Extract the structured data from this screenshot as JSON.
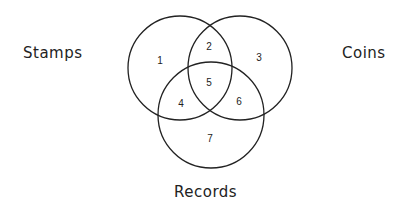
{
  "diagram": {
    "type": "venn",
    "sets": [
      {
        "label": "Stamps",
        "region_only": "1"
      },
      {
        "label": "Coins",
        "region_only": "3"
      },
      {
        "label": "Records",
        "region_only": "7"
      }
    ],
    "regions": {
      "stamps_only": "1",
      "stamps_coins": "2",
      "coins_only": "3",
      "stamps_records": "4",
      "all_three": "5",
      "coins_records": "6",
      "records_only": "7"
    },
    "stroke_color": "#222222"
  }
}
